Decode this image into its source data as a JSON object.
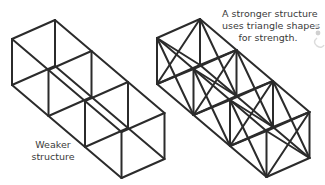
{
  "figure": {
    "type": "structural comparison diagram",
    "stroke_color": "#2b2b2b",
    "text_color": "#3a3a3a",
    "structures": [
      {
        "id": "weaker",
        "label_lines": [
          "Weaker",
          "structure"
        ],
        "cells": 3,
        "origin": [
          55,
          20
        ],
        "braced": false
      },
      {
        "id": "stronger",
        "label_lines": [
          "A stronger structure",
          "uses triangle shapes",
          "for strength."
        ],
        "cells": 3,
        "origin": [
          200,
          19
        ],
        "braced": true
      }
    ],
    "vectors": {
      "length": [
        36.5,
        31
      ],
      "width": [
        -43,
        19
      ],
      "height": [
        0,
        46
      ]
    }
  },
  "labels": {
    "weak": {
      "line1": "Weaker",
      "line2": "structure"
    },
    "strong": {
      "line1": "A stronger structure",
      "line2": "uses triangle shapes",
      "line3": "for strength."
    }
  }
}
